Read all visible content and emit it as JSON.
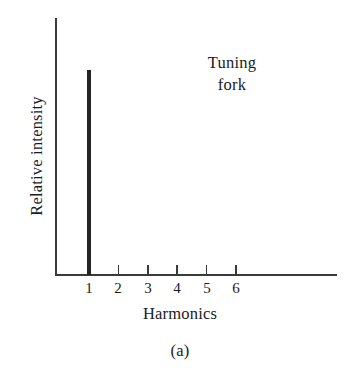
{
  "figure": {
    "caption": "(a)",
    "background_color": "#ffffff",
    "ink_color": "#242424",
    "axis_color": "#3a3a3a"
  },
  "annotation": {
    "line1": "Tuning",
    "line2": "fork"
  },
  "chart_data": {
    "type": "bar",
    "title": "",
    "subtitle": "",
    "xlabel": "Harmonics",
    "ylabel": "Relative intensity",
    "categories": [
      "1",
      "2",
      "3",
      "4",
      "5",
      "6"
    ],
    "values": [
      1.0,
      0,
      0,
      0,
      0,
      0
    ],
    "series": [
      {
        "name": "Tuning fork",
        "values": [
          1.0,
          0,
          0,
          0,
          0,
          0
        ]
      }
    ],
    "xlim": [
      0.45,
      7.2
    ],
    "ylim": [
      0,
      1.09
    ],
    "grid": false,
    "legend": false,
    "legend_position": "inside-top-right",
    "annotations": [
      {
        "text": "Tuning fork",
        "x": 4.5,
        "y": 0.92
      }
    ],
    "tick_labels_y": [],
    "bar_color": "#242424"
  },
  "geometry": {
    "axis_origin_x": 56,
    "axis_origin_y": 275,
    "y_axis_top": 18,
    "x_axis_right": 337,
    "tick_x_positions": [
      89,
      118.4,
      147.8,
      177.2,
      206.6,
      236
    ],
    "tick_length": 10,
    "spike_top_y": 70
  }
}
